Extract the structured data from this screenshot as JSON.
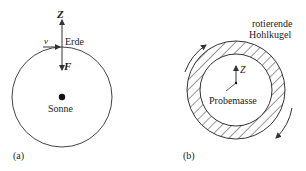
{
  "panel_a": {
    "tag": "(a)",
    "axis_label": "Z",
    "velocity_label": "v",
    "earth_label": "Erde",
    "force_label": "F",
    "sun_label": "Sonne"
  },
  "panel_b": {
    "tag": "(b)",
    "shell_label_line1": "rotierende",
    "shell_label_line2": "Hohlkugel",
    "axis_label": "Z",
    "mass_label": "Probemasse"
  },
  "colors": {
    "stroke": "#333333",
    "text": "#222222",
    "background": "#ffffff"
  }
}
